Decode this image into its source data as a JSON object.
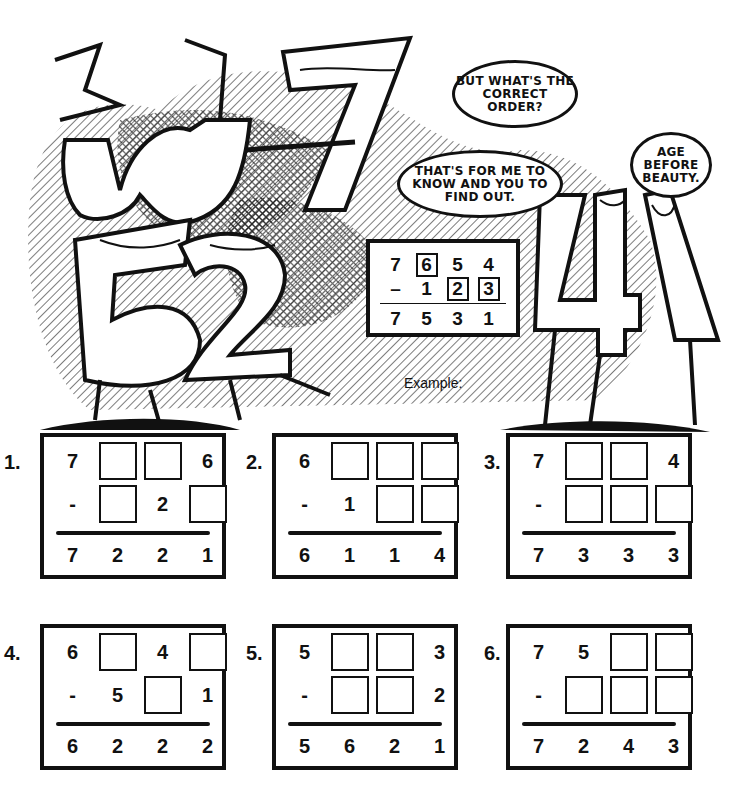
{
  "illustration": {
    "characters": [
      "3 (as w)",
      "7",
      "5",
      "2",
      "4",
      "1"
    ],
    "bubbles": [
      {
        "id": "correct-order",
        "text": "But what's the correct order?"
      },
      {
        "id": "for-me-to-know",
        "text": "That's for me to know and you to find out."
      },
      {
        "id": "age-before-beauty",
        "text": "Age before beauty."
      }
    ]
  },
  "example": {
    "label": "Example:",
    "rows": [
      [
        {
          "v": "7"
        },
        {
          "v": "6",
          "box": true
        },
        {
          "v": "5"
        },
        {
          "v": "4"
        }
      ],
      [
        {
          "v": "–"
        },
        {
          "v": "1"
        },
        {
          "v": "2",
          "box": true
        },
        {
          "v": "3",
          "box": true
        }
      ],
      [
        {
          "v": "7"
        },
        {
          "v": "5"
        },
        {
          "v": "3"
        },
        {
          "v": "1"
        }
      ]
    ]
  },
  "puzzles": [
    {
      "number": "1.",
      "top": [
        "7",
        "",
        "",
        "6"
      ],
      "mid": [
        "-",
        "",
        "2",
        ""
      ],
      "result": [
        "7",
        "2",
        "2",
        "1"
      ],
      "top_blank": [
        false,
        true,
        true,
        false
      ],
      "mid_blank": [
        false,
        true,
        false,
        true
      ]
    },
    {
      "number": "2.",
      "top": [
        "6",
        "",
        "",
        ""
      ],
      "mid": [
        "-",
        "1",
        "",
        ""
      ],
      "result": [
        "6",
        "1",
        "1",
        "4"
      ],
      "top_blank": [
        false,
        true,
        true,
        true
      ],
      "mid_blank": [
        false,
        false,
        true,
        true
      ]
    },
    {
      "number": "3.",
      "top": [
        "7",
        "",
        "",
        "4"
      ],
      "mid": [
        "-",
        "",
        "",
        ""
      ],
      "result": [
        "7",
        "3",
        "3",
        "3"
      ],
      "top_blank": [
        false,
        true,
        true,
        false
      ],
      "mid_blank": [
        false,
        true,
        true,
        true
      ]
    },
    {
      "number": "4.",
      "top": [
        "6",
        "",
        "4",
        ""
      ],
      "mid": [
        "-",
        "5",
        "",
        "1"
      ],
      "result": [
        "6",
        "2",
        "2",
        "2"
      ],
      "top_blank": [
        false,
        true,
        false,
        true
      ],
      "mid_blank": [
        false,
        false,
        true,
        false
      ]
    },
    {
      "number": "5.",
      "top": [
        "5",
        "",
        "",
        "3"
      ],
      "mid": [
        "-",
        "",
        "",
        "2"
      ],
      "result": [
        "5",
        "6",
        "2",
        "1"
      ],
      "top_blank": [
        false,
        true,
        true,
        false
      ],
      "mid_blank": [
        false,
        true,
        true,
        false
      ]
    },
    {
      "number": "6.",
      "top": [
        "7",
        "5",
        "",
        ""
      ],
      "mid": [
        "-",
        "",
        "",
        ""
      ],
      "result": [
        "7",
        "2",
        "4",
        "3"
      ],
      "top_blank": [
        false,
        false,
        true,
        true
      ],
      "mid_blank": [
        false,
        true,
        true,
        true
      ]
    }
  ]
}
